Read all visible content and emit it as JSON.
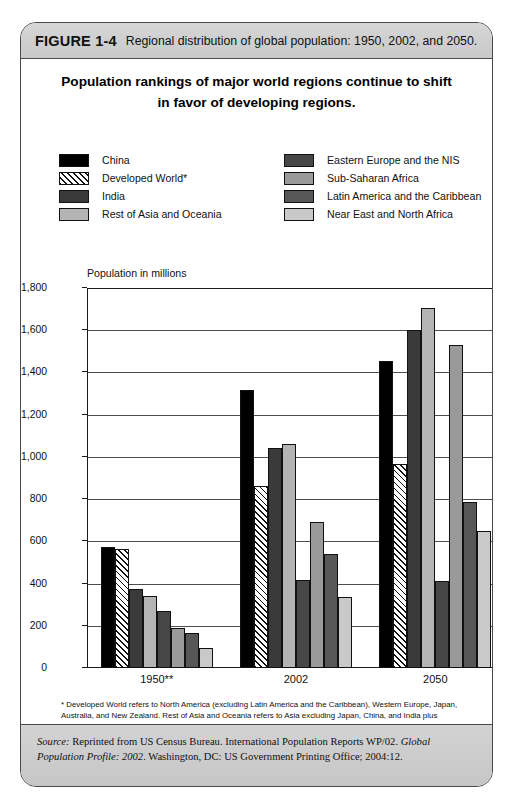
{
  "figure": {
    "number": "FIGURE 1-4",
    "caption": "Regional distribution of global population: 1950, 2002, and 2050."
  },
  "title_line1": "Population rankings of major world regions continue to shift",
  "title_line2": "in favor of developing regions.",
  "legend": {
    "left": [
      {
        "label": "China",
        "swatch": "sw-black",
        "color": "#000000"
      },
      {
        "label": "Developed World*",
        "swatch": "sw-hatch",
        "color": "#ffffff"
      },
      {
        "label": "India",
        "swatch": "sw-india",
        "color": "#3a3a3a"
      },
      {
        "label": "Rest of Asia and Oceania",
        "swatch": "sw-restasia",
        "color": "#b4b4b4"
      }
    ],
    "right": [
      {
        "label": "Eastern Europe and the NIS",
        "swatch": "sw-ee",
        "color": "#474747"
      },
      {
        "label": "Sub-Saharan Africa",
        "swatch": "sw-ssa",
        "color": "#9a9a9a"
      },
      {
        "label": "Latin America and the Caribbean",
        "swatch": "sw-lac",
        "color": "#575757"
      },
      {
        "label": "Near East and North Africa",
        "swatch": "sw-nena",
        "color": "#c9c9c9"
      }
    ]
  },
  "axis_caption": "Population in millions",
  "footnote_line1": "* Developed World refers to North America (excluding Latin America and the Caribbean), Western Europe, Japan,",
  "footnote_line2": "Australia, and New Zealand.  Rest of Asia and Oceania refers to Asia excluding Japan, China, and India plus Oceania",
  "footnote_line3": "excluding Australia and New Zealand.  NIS indicates the New Independent States of the former Soviet Union.",
  "footnote_line4": "** Current boundaries.",
  "source": {
    "label": "Source:",
    "text1": " Reprinted from US Census Bureau. International Population Reports WP/02. ",
    "italic1": "Global Population Profile: 2002",
    "text2": ". Washington, DC: US Government Printing Office; 2004:12."
  },
  "chart_data": {
    "type": "bar",
    "title": "Population rankings of major world regions continue to shift in favor of developing regions.",
    "xlabel": "",
    "ylabel": "Population in millions",
    "ylim": [
      0,
      1800
    ],
    "yticks": [
      0,
      200,
      400,
      600,
      800,
      1000,
      1200,
      1400,
      1600,
      1800
    ],
    "ytick_labels": [
      "0",
      "200",
      "400",
      "600",
      "800",
      "1,000",
      "1,200",
      "1,400",
      "1,600",
      "1,800"
    ],
    "grid": true,
    "legend_position": "above-plot",
    "categories": [
      "1950**",
      "2002",
      "2050"
    ],
    "series": [
      {
        "name": "China",
        "values": [
          575,
          1315,
          1455
        ]
      },
      {
        "name": "Developed World*",
        "values": [
          565,
          860,
          965
        ]
      },
      {
        "name": "India",
        "values": [
          375,
          1040,
          1600
        ]
      },
      {
        "name": "Rest of Asia and Oceania",
        "values": [
          340,
          1060,
          1705
        ]
      },
      {
        "name": "Eastern Europe and the NIS",
        "values": [
          270,
          415,
          410
        ]
      },
      {
        "name": "Sub-Saharan Africa",
        "values": [
          190,
          690,
          1530
        ]
      },
      {
        "name": "Latin America and the Caribbean",
        "values": [
          165,
          540,
          785
        ]
      },
      {
        "name": "Near East and North Africa",
        "values": [
          95,
          335,
          650
        ]
      }
    ]
  }
}
